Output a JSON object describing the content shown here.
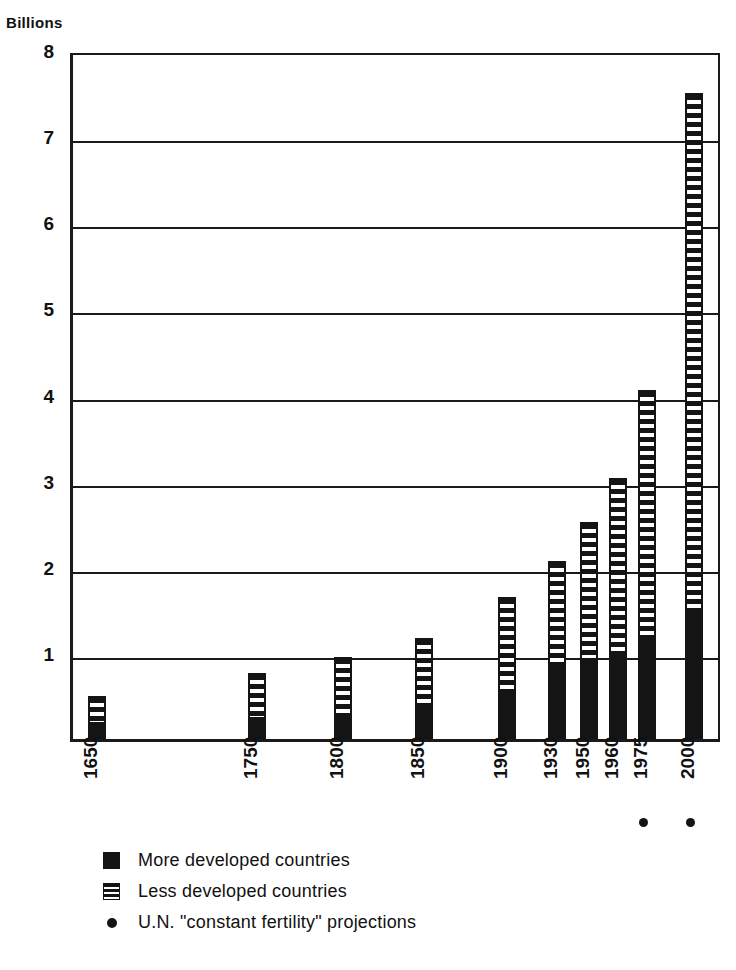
{
  "chart_data": {
    "type": "bar",
    "title": "",
    "subtitle": "",
    "ylabel": "Billions",
    "xlabel": "",
    "ylim": [
      0,
      8
    ],
    "yticks": [
      1,
      2,
      3,
      4,
      5,
      6,
      7,
      8
    ],
    "ytick_labels": [
      "1",
      "2",
      "3",
      "4",
      "5",
      "6",
      "7",
      "8"
    ],
    "grid": true,
    "stacked": true,
    "legend_position": "below-axis",
    "categories": [
      "1650",
      "1750",
      "1800",
      "1850",
      "1900",
      "1930",
      "1950",
      "1960",
      "1975",
      "2000"
    ],
    "projection_categories": [
      "1975",
      "2000"
    ],
    "series": [
      {
        "name": "More developed countries",
        "pattern": "solid",
        "color": "#141414",
        "values": [
          0.17,
          0.23,
          0.28,
          0.35,
          0.5,
          0.85,
          0.92,
          1.0,
          1.18,
          1.45
        ]
      },
      {
        "name": "Less developed countries",
        "pattern": "horizontal-stripes",
        "color": "#141414",
        "values": [
          0.33,
          0.54,
          0.67,
          0.82,
          1.15,
          1.22,
          1.6,
          2.03,
          2.87,
          6.05
        ]
      }
    ],
    "totals": [
      0.5,
      0.77,
      0.95,
      1.17,
      1.65,
      2.07,
      2.52,
      3.03,
      4.05,
      7.5
    ],
    "bar_positions_px": [
      85,
      245,
      331,
      412,
      495,
      545,
      577,
      606,
      635,
      682
    ],
    "bar_width_px": 18,
    "annotations": []
  },
  "legend": {
    "items": [
      {
        "marker": "solid-square-swatch",
        "label": "More developed countries"
      },
      {
        "marker": "striped-square-swatch",
        "label": "Less developed countries"
      },
      {
        "marker": "dot-marker",
        "label": "U.N. \"constant fertility\" projections"
      }
    ]
  },
  "colors": {
    "ink": "#141414",
    "background": "#ffffff"
  }
}
